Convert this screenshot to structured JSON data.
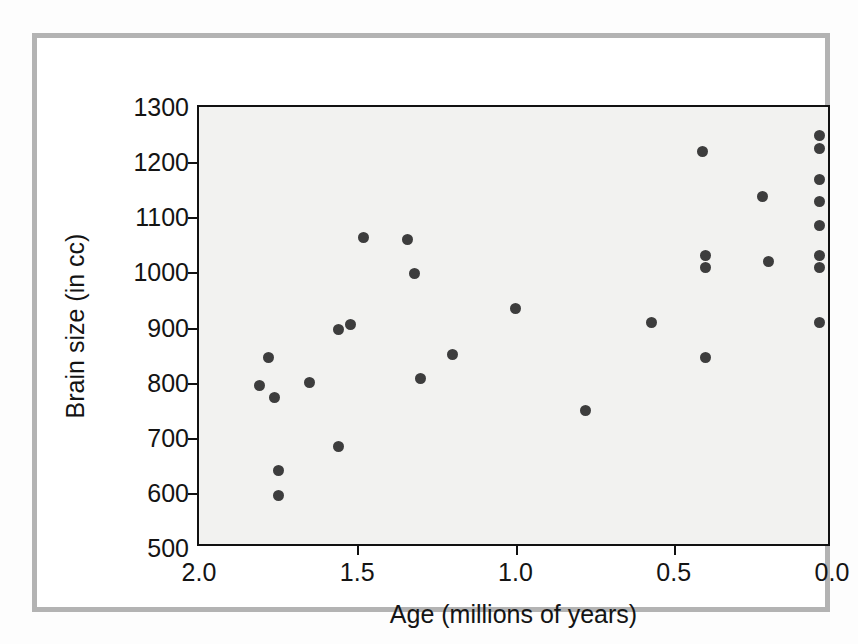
{
  "chart_data": {
    "type": "scatter",
    "title": "",
    "xlabel": "Age (millions of years)",
    "ylabel": "Brain size (in cc)",
    "xlim": [
      2.0,
      0.0
    ],
    "ylim": [
      500,
      1300
    ],
    "x_reversed": true,
    "grid": false,
    "legend": null,
    "xticks": [
      "2.0",
      "1.5",
      "1.0",
      "0.5",
      "0.0"
    ],
    "xtick_values": [
      2.0,
      1.5,
      1.0,
      0.5,
      0.0
    ],
    "yticks": [
      "500",
      "600",
      "700",
      "800",
      "900",
      "1000",
      "1100",
      "1200",
      "1300"
    ],
    "ytick_values": [
      500,
      600,
      700,
      800,
      900,
      1000,
      1100,
      1200,
      1300
    ],
    "marker": {
      "shape": "circle",
      "color": "#3d3d3d",
      "size_px": 11
    },
    "point_count": 33,
    "points": [
      {
        "x": 1.81,
        "y": 795
      },
      {
        "x": 1.78,
        "y": 845
      },
      {
        "x": 1.76,
        "y": 773
      },
      {
        "x": 1.75,
        "y": 641
      },
      {
        "x": 1.75,
        "y": 595
      },
      {
        "x": 1.65,
        "y": 801
      },
      {
        "x": 1.56,
        "y": 897
      },
      {
        "x": 1.56,
        "y": 685
      },
      {
        "x": 1.52,
        "y": 905
      },
      {
        "x": 1.48,
        "y": 1063
      },
      {
        "x": 1.34,
        "y": 1060
      },
      {
        "x": 1.32,
        "y": 998
      },
      {
        "x": 1.3,
        "y": 808
      },
      {
        "x": 1.2,
        "y": 851
      },
      {
        "x": 1.0,
        "y": 935
      },
      {
        "x": 0.78,
        "y": 750
      },
      {
        "x": 0.57,
        "y": 909
      },
      {
        "x": 0.41,
        "y": 1220
      },
      {
        "x": 0.4,
        "y": 1030
      },
      {
        "x": 0.4,
        "y": 1008
      },
      {
        "x": 0.4,
        "y": 845
      },
      {
        "x": 0.22,
        "y": 1137
      },
      {
        "x": 0.2,
        "y": 1020
      },
      {
        "x": 0.04,
        "y": 1248
      },
      {
        "x": 0.04,
        "y": 1225
      },
      {
        "x": 0.04,
        "y": 1168
      },
      {
        "x": 0.04,
        "y": 1128
      },
      {
        "x": 0.04,
        "y": 1085
      },
      {
        "x": 0.04,
        "y": 1030
      },
      {
        "x": 0.04,
        "y": 1008
      },
      {
        "x": 0.04,
        "y": 909
      }
    ]
  }
}
